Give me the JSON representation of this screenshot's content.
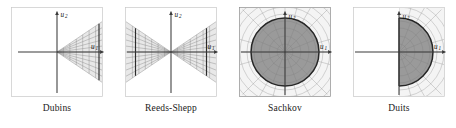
{
  "figure": {
    "panel_count": 4,
    "axis_labels": {
      "horizontal": "u",
      "horizontal_sub": "1",
      "vertical": "u",
      "vertical_sub": "2"
    },
    "colors": {
      "fill_dark": "#9a9a9a",
      "fill_light": "#ededed",
      "grid_line": "#8e8e8e",
      "boundary": "#2b2b2b",
      "axis": "#3a3a3a",
      "frame": "#c8c8c8",
      "background": "#ffffff",
      "caption_text": "#1a1a1a"
    },
    "panels": [
      {
        "id": "dubins",
        "caption": "Dubins",
        "shape": "right-cone",
        "description": "Cone with apex at origin opening toward positive u1, filled with radial and transverse grid lines, bounded on the right by a dark vertical segment.",
        "half_angle_deg": 34,
        "grid_radials": 11,
        "grid_arcs": 7
      },
      {
        "id": "reeds-shepp",
        "caption": "Reeds-Shepp",
        "shape": "double-cone",
        "description": "Bowtie of two opposing cones with common apex at origin, each filled with grid lines and bounded by a dark vertical segment.",
        "half_angle_deg": 34,
        "grid_radials": 11,
        "grid_arcs": 7
      },
      {
        "id": "sachkov",
        "caption": "Sachkov",
        "shape": "full-disc",
        "description": "Filled circular disc centred on the origin drawn over a full polar grid that extends past the disc to the square frame.",
        "radius_fraction": 0.78,
        "grid_radials": 24,
        "grid_arcs": 7
      },
      {
        "id": "duits",
        "caption": "Duits",
        "shape": "half-disc",
        "description": "Filled half disc on the positive u1 side of the vertical axis, with the polar grid shown only in the right half plane.",
        "radius_fraction": 0.78,
        "grid_radials": 12,
        "grid_arcs": 7
      }
    ]
  }
}
